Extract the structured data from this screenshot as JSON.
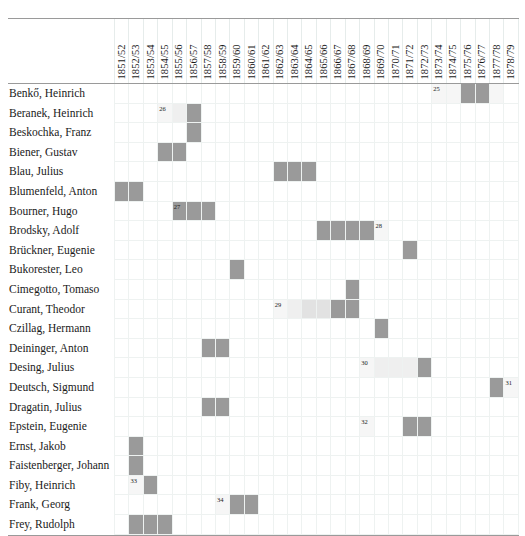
{
  "table": {
    "corner_label": "",
    "columns": [
      "1851/52",
      "1852/53",
      "1853/54",
      "1854/55",
      "1855/56",
      "1856/57",
      "1857/58",
      "1858/59",
      "1859/60",
      "1860/61",
      "1861/62",
      "1862/63",
      "1863/64",
      "1864/65",
      "1865/66",
      "1866/67",
      "1867/68",
      "1868/69",
      "1869/70",
      "1870/71",
      "1871/72",
      "1872/73",
      "1873/74",
      "1874/75",
      "1875/76",
      "1876/77",
      "1877/78",
      "1878/79"
    ],
    "rows": [
      {
        "label": "Benkő, Heinrich",
        "cells": [
          {
            "c": 22,
            "shade": "pale",
            "note": "25"
          },
          {
            "c": 23,
            "shade": "pale"
          },
          {
            "c": 24,
            "shade": "full"
          },
          {
            "c": 25,
            "shade": "full"
          },
          {
            "c": 26,
            "shade": "pale"
          }
        ]
      },
      {
        "label": "Beranek, Heinrich",
        "cells": [
          {
            "c": 3,
            "shade": "pale",
            "note": "26"
          },
          {
            "c": 4,
            "shade": "faint"
          },
          {
            "c": 5,
            "shade": "full"
          }
        ]
      },
      {
        "label": "Beskochka, Franz",
        "cells": [
          {
            "c": 5,
            "shade": "full"
          }
        ]
      },
      {
        "label": "Biener, Gustav",
        "cells": [
          {
            "c": 3,
            "shade": "full"
          },
          {
            "c": 4,
            "shade": "full"
          }
        ]
      },
      {
        "label": "Blau, Julius",
        "cells": [
          {
            "c": 11,
            "shade": "full"
          },
          {
            "c": 12,
            "shade": "full"
          },
          {
            "c": 13,
            "shade": "full"
          }
        ]
      },
      {
        "label": "Blumenfeld, Anton",
        "cells": [
          {
            "c": 0,
            "shade": "full"
          },
          {
            "c": 1,
            "shade": "full"
          }
        ]
      },
      {
        "label": "Bourner, Hugo",
        "cells": [
          {
            "c": 4,
            "shade": "full",
            "note": "27"
          },
          {
            "c": 5,
            "shade": "full"
          },
          {
            "c": 6,
            "shade": "full"
          }
        ]
      },
      {
        "label": "Brodsky, Adolf",
        "cells": [
          {
            "c": 14,
            "shade": "full"
          },
          {
            "c": 15,
            "shade": "full"
          },
          {
            "c": 16,
            "shade": "full"
          },
          {
            "c": 17,
            "shade": "full"
          },
          {
            "c": 18,
            "shade": "pale",
            "note": "28"
          }
        ]
      },
      {
        "label": "Brückner, Eugenie",
        "cells": [
          {
            "c": 20,
            "shade": "full"
          }
        ]
      },
      {
        "label": "Bukorester, Leo",
        "cells": [
          {
            "c": 8,
            "shade": "full"
          }
        ]
      },
      {
        "label": "Cimegotto, Tomaso",
        "cells": [
          {
            "c": 16,
            "shade": "full"
          }
        ]
      },
      {
        "label": "Curant, Theodor",
        "cells": [
          {
            "c": 11,
            "shade": "pale",
            "note": "29"
          },
          {
            "c": 12,
            "shade": "faint"
          },
          {
            "c": 13,
            "shade": "light"
          },
          {
            "c": 14,
            "shade": "light"
          },
          {
            "c": 15,
            "shade": "full"
          },
          {
            "c": 16,
            "shade": "full"
          }
        ]
      },
      {
        "label": "Czillag, Hermann",
        "cells": [
          {
            "c": 18,
            "shade": "full"
          }
        ]
      },
      {
        "label": "Deininger, Anton",
        "cells": [
          {
            "c": 6,
            "shade": "full"
          },
          {
            "c": 7,
            "shade": "full"
          }
        ]
      },
      {
        "label": "Desing, Julius",
        "cells": [
          {
            "c": 17,
            "shade": "pale",
            "note": "30"
          },
          {
            "c": 18,
            "shade": "faint"
          },
          {
            "c": 19,
            "shade": "faint"
          },
          {
            "c": 20,
            "shade": "faint"
          },
          {
            "c": 21,
            "shade": "full"
          }
        ]
      },
      {
        "label": "Deutsch, Sigmund",
        "cells": [
          {
            "c": 26,
            "shade": "full"
          },
          {
            "c": 27,
            "shade": "pale",
            "note": "31"
          }
        ]
      },
      {
        "label": "Dragatin, Julius",
        "cells": [
          {
            "c": 6,
            "shade": "full"
          },
          {
            "c": 7,
            "shade": "full"
          }
        ]
      },
      {
        "label": "Epstein, Eugenie",
        "cells": [
          {
            "c": 17,
            "shade": "pale",
            "note": "32"
          },
          {
            "c": 20,
            "shade": "full"
          },
          {
            "c": 21,
            "shade": "full"
          }
        ]
      },
      {
        "label": "Ernst, Jakob",
        "cells": [
          {
            "c": 1,
            "shade": "full"
          }
        ]
      },
      {
        "label": "Faistenberger, Johann",
        "cells": [
          {
            "c": 1,
            "shade": "full"
          }
        ]
      },
      {
        "label": "Fiby, Heinrich",
        "cells": [
          {
            "c": 1,
            "shade": "pale",
            "note": "33"
          },
          {
            "c": 2,
            "shade": "full"
          }
        ]
      },
      {
        "label": "Frank, Georg",
        "cells": [
          {
            "c": 7,
            "shade": "pale",
            "note": "34"
          },
          {
            "c": 8,
            "shade": "full"
          },
          {
            "c": 9,
            "shade": "full"
          }
        ]
      },
      {
        "label": "Frey, Rudolph",
        "cells": [
          {
            "c": 1,
            "shade": "full"
          },
          {
            "c": 2,
            "shade": "full"
          },
          {
            "c": 3,
            "shade": "full"
          }
        ]
      }
    ]
  },
  "colors": {
    "full": "#9a9a9a",
    "mid": "#c9c9c9",
    "light": "#e2e2e2",
    "faint": "#efefef",
    "pale": "#f6f6f6",
    "grid": "#eef2f1",
    "rule": "#9a9a9a"
  }
}
